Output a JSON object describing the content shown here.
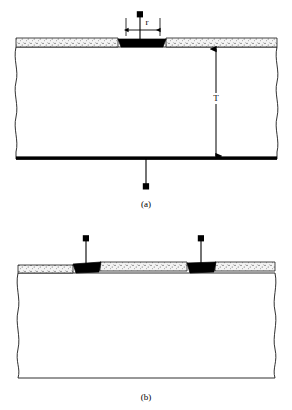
{
  "figure": {
    "title": "",
    "kind": "technical-cross-section-diagram",
    "background_color": "#ffffff",
    "ink_color": "#000000",
    "contact_color": "#000000",
    "dielectric_fill": "#ffffff",
    "stipple_layer_color": "#f2f2f2",
    "stipple_dot_color": "#555555"
  },
  "panels": [
    {
      "id": "panel-a",
      "caption": "(a)",
      "caption_x": 146,
      "caption_y": 205,
      "description": "single top contact with bottom electrode",
      "dimensions": [
        {
          "name": "contact-width",
          "label": "r",
          "label_x": 147,
          "label_y": 24,
          "orientation": "horizontal",
          "x1": 126,
          "x2": 160,
          "y": 30
        },
        {
          "name": "substrate-thickness",
          "label": "T",
          "label_x": 216,
          "label_y": 99,
          "orientation": "vertical",
          "y1": 48,
          "y2": 157,
          "x": 216
        }
      ],
      "leads": [
        {
          "name": "top-lead",
          "terminal_x": 140,
          "terminal_y": 14,
          "wire_x": 140,
          "wire_y1": 14,
          "wire_y2": 44
        },
        {
          "name": "bottom-lead",
          "terminal_x": 146,
          "terminal_y": 186,
          "wire_x": 146,
          "wire_y1": 159,
          "wire_y2": 186
        }
      ],
      "contacts": [
        {
          "name": "top-contact",
          "x_left": 118,
          "x_right": 166,
          "y_top": 39,
          "y_bottom": 47
        }
      ],
      "bottom_electrode": {
        "present": true,
        "y": 158,
        "thickness": 3.5
      }
    },
    {
      "id": "panel-b",
      "caption": "(b)",
      "caption_x": 146,
      "caption_y": 398,
      "description": "two coplanar top contacts, no bottom electrode",
      "dimensions": [],
      "leads": [
        {
          "name": "left-lead",
          "terminal_x": 86,
          "terminal_y": 238,
          "wire_x": 86,
          "wire_y1": 238,
          "wire_y2": 268
        },
        {
          "name": "right-lead",
          "terminal_x": 201,
          "terminal_y": 238,
          "wire_x": 201,
          "wire_y1": 238,
          "wire_y2": 268
        }
      ],
      "contacts": [
        {
          "name": "left-contact",
          "x_left": 73,
          "x_right": 100,
          "y_top": 264,
          "y_bottom": 273
        },
        {
          "name": "right-contact",
          "x_left": 187,
          "x_right": 215,
          "y_top": 264,
          "y_bottom": 273
        }
      ],
      "bottom_electrode": {
        "present": false,
        "y": 378,
        "thickness": 0.9
      }
    }
  ],
  "annotations": {
    "dimension_r": "r",
    "dimension_T": "T",
    "caption_a": "(a)",
    "caption_b": "(b)"
  }
}
